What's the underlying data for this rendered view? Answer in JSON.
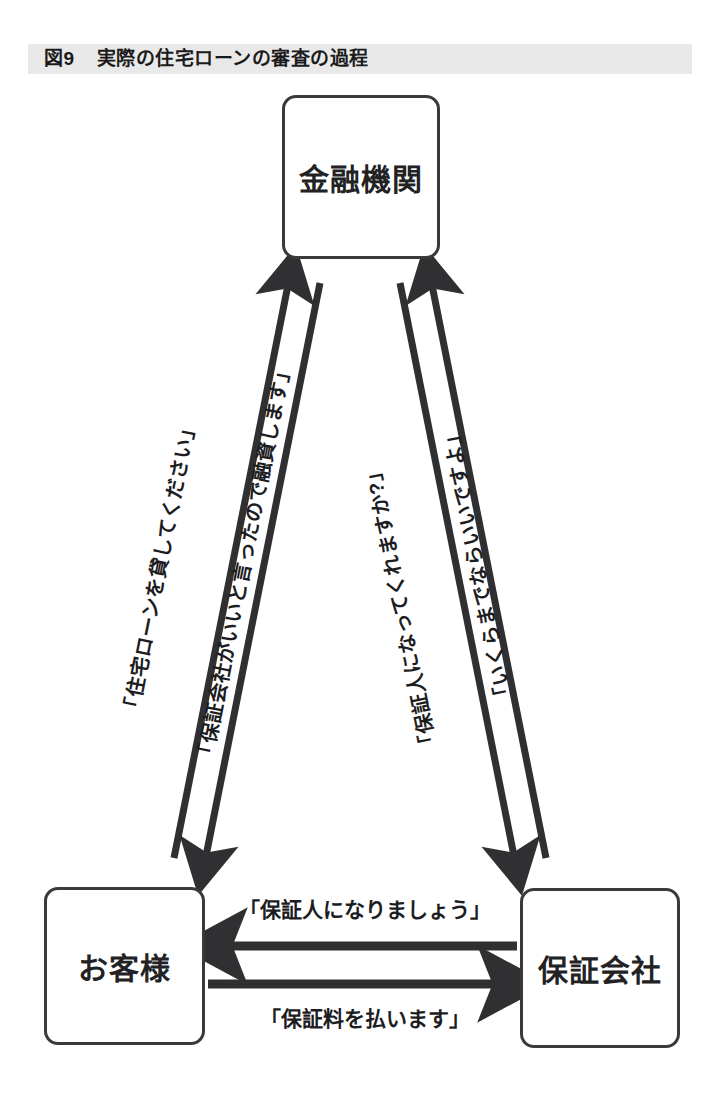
{
  "figure": {
    "number": "図9",
    "title": "実際の住宅ローンの審査の過程",
    "band_color": "#e9e9e9",
    "line_color": "#303032",
    "box_border_color": "#3a3a3c",
    "text_color": "#1d1d1f",
    "background_color": "#ffffff"
  },
  "nodes": {
    "bank": {
      "label": "金融機関"
    },
    "customer": {
      "label": "お客様"
    },
    "guarantor": {
      "label": "保証会社"
    }
  },
  "edges": {
    "customer_to_bank": {
      "label": "「住宅ローンを貸してください」",
      "from": "customer",
      "to": "bank",
      "direction": "up"
    },
    "bank_to_customer": {
      "label": "「保証会社がいいと言ったので融資します」",
      "from": "bank",
      "to": "customer",
      "direction": "down"
    },
    "bank_to_guarantor": {
      "label": "「保証人になってくれますか?」",
      "from": "bank",
      "to": "guarantor",
      "direction": "down"
    },
    "guarantor_to_bank": {
      "label": "「いくらまでならいいですよ」",
      "from": "guarantor",
      "to": "bank",
      "direction": "up"
    },
    "guarantor_to_customer": {
      "label": "「保証人になりましょう」",
      "from": "guarantor",
      "to": "customer",
      "direction": "left"
    },
    "customer_to_guarantor": {
      "label": "「保証料を払います」",
      "from": "customer",
      "to": "guarantor",
      "direction": "right"
    }
  }
}
